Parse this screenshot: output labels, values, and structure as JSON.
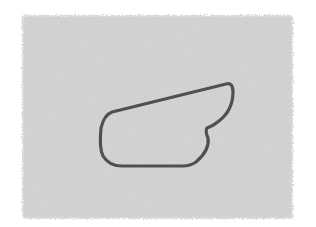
{
  "scene": {
    "background_color": "#ffffff",
    "panel": {
      "color": "#d9d9d9",
      "x": 22,
      "y": 15,
      "width": 271,
      "height": 204
    },
    "shape": {
      "description": "wing-shaped outline",
      "stroke_color": "#505050",
      "stroke_width": 3.2,
      "fill": "none"
    }
  }
}
